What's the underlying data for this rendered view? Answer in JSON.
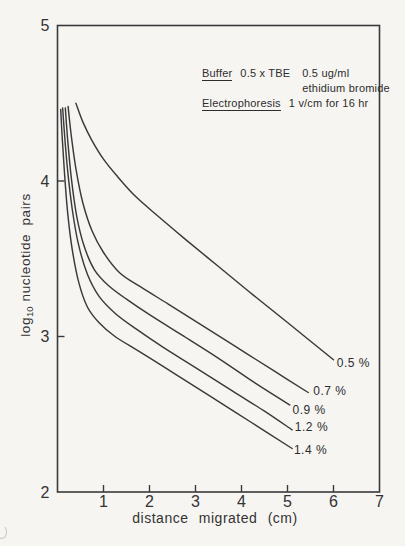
{
  "figure": {
    "background": "#f6f5f2",
    "ink": "#3a3a3a"
  },
  "chart_data": {
    "type": "line",
    "title": "",
    "xlabel": "distance migrated (cm)",
    "ylabel": "log10 nucleotide pairs",
    "ylabel_parts": {
      "prefix": "log",
      "sub": "10",
      "rest": "nucleotide pairs"
    },
    "xlim": [
      0,
      7
    ],
    "ylim": [
      2,
      5
    ],
    "x_ticks": [
      1,
      2,
      3,
      4,
      5,
      6,
      7
    ],
    "x_ticks_with_marks": [
      1,
      2,
      3,
      4,
      5,
      6
    ],
    "y_ticks": [
      5,
      4,
      3,
      2
    ],
    "y_ticks_with_marks": [
      4,
      3
    ],
    "grid": false,
    "legend_position": "labels-at-line-ends",
    "annotation": {
      "line1_label": "Buffer",
      "line1_text1": "0.5 x TBE",
      "line1_text2": "0.5 ug/ml",
      "line2": "ethidium bromide",
      "line3_label": "Electrophoresis",
      "line3_text": "1 v/cm for 16 hr"
    },
    "series": [
      {
        "name": "0.5% agarose",
        "label": "0.5 %",
        "label_pos": [
          6.07,
          2.83
        ],
        "points": [
          [
            0.4,
            4.5
          ],
          [
            0.55,
            4.38
          ],
          [
            0.75,
            4.26
          ],
          [
            1.0,
            4.14
          ],
          [
            1.3,
            4.03
          ],
          [
            1.7,
            3.9
          ],
          [
            2.2,
            3.77
          ],
          [
            2.8,
            3.62
          ],
          [
            3.5,
            3.45
          ],
          [
            4.2,
            3.28
          ],
          [
            5.0,
            3.09
          ],
          [
            6.0,
            2.85
          ]
        ]
      },
      {
        "name": "0.7% agarose",
        "label": "0.7 %",
        "label_pos": [
          5.56,
          2.65
        ],
        "points": [
          [
            0.23,
            4.48
          ],
          [
            0.3,
            4.29
          ],
          [
            0.4,
            4.08
          ],
          [
            0.55,
            3.86
          ],
          [
            0.75,
            3.68
          ],
          [
            1.0,
            3.54
          ],
          [
            1.35,
            3.41
          ],
          [
            1.8,
            3.32
          ],
          [
            2.4,
            3.21
          ],
          [
            3.1,
            3.08
          ],
          [
            3.9,
            2.93
          ],
          [
            4.7,
            2.78
          ],
          [
            5.45,
            2.64
          ]
        ]
      },
      {
        "name": "0.9% agarose",
        "label": "0.9 %",
        "label_pos": [
          5.11,
          2.53
        ],
        "points": [
          [
            0.17,
            4.47
          ],
          [
            0.22,
            4.27
          ],
          [
            0.3,
            4.02
          ],
          [
            0.42,
            3.77
          ],
          [
            0.58,
            3.58
          ],
          [
            0.8,
            3.43
          ],
          [
            1.1,
            3.33
          ],
          [
            1.5,
            3.24
          ],
          [
            2.0,
            3.14
          ],
          [
            2.7,
            3.01
          ],
          [
            3.5,
            2.86
          ],
          [
            4.3,
            2.7
          ],
          [
            5.05,
            2.56
          ]
        ]
      },
      {
        "name": "1.2% agarose",
        "label": "1.2 %",
        "label_pos": [
          5.16,
          2.42
        ],
        "points": [
          [
            0.11,
            4.47
          ],
          [
            0.15,
            4.31
          ],
          [
            0.22,
            4.07
          ],
          [
            0.32,
            3.82
          ],
          [
            0.45,
            3.6
          ],
          [
            0.65,
            3.4
          ],
          [
            0.9,
            3.26
          ],
          [
            1.25,
            3.15
          ],
          [
            1.7,
            3.05
          ],
          [
            2.3,
            2.93
          ],
          [
            3.0,
            2.8
          ],
          [
            3.8,
            2.65
          ],
          [
            4.5,
            2.52
          ],
          [
            5.1,
            2.4
          ]
        ]
      },
      {
        "name": "1.4% agarose",
        "label": "1.4 %",
        "label_pos": [
          5.14,
          2.27
        ],
        "points": [
          [
            0.07,
            4.46
          ],
          [
            0.1,
            4.29
          ],
          [
            0.15,
            4.06
          ],
          [
            0.22,
            3.8
          ],
          [
            0.32,
            3.56
          ],
          [
            0.46,
            3.35
          ],
          [
            0.65,
            3.19
          ],
          [
            0.9,
            3.09
          ],
          [
            1.25,
            3.0
          ],
          [
            1.8,
            2.9
          ],
          [
            2.5,
            2.77
          ],
          [
            3.3,
            2.62
          ],
          [
            4.2,
            2.45
          ],
          [
            5.1,
            2.28
          ]
        ]
      }
    ]
  }
}
